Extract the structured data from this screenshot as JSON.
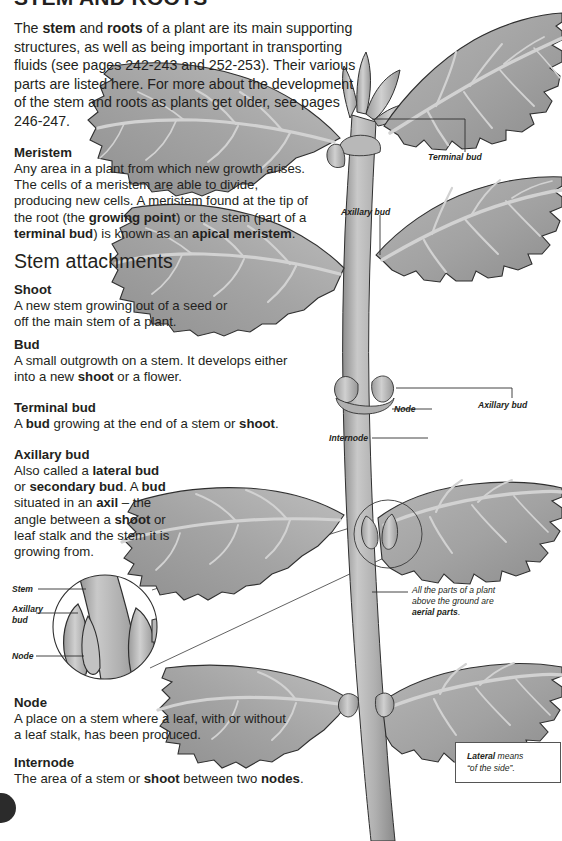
{
  "page": {
    "clipped_heading": "STEM AND ROOTS",
    "intro": "The stem and roots of a plant are its main supporting structures, as well as being important in transporting fluids (see pages 242-243 and 252-253). Their various parts are listed here. For more about the development of the stem and roots as plants get older, see pages 246-247.",
    "intro_bold_terms": [
      "stem",
      "roots"
    ]
  },
  "sections": [
    {
      "id": "meristem",
      "heading": "Meristem",
      "body": "Any area in a plant from which new growth arises. The cells of a meristem are able to divide, producing new cells. A meristem found at the tip of the root (the growing point) or the stem (part of a terminal bud) is known as an apical meristem.",
      "bold_terms": [
        "growing point",
        "terminal bud",
        "apical meristem"
      ]
    },
    {
      "id": "shoot",
      "heading": "Shoot",
      "body": "A new stem growing out of a seed or off the main stem of a plant.",
      "bold_terms": []
    },
    {
      "id": "bud",
      "heading": "Bud",
      "body": "A small outgrowth on a stem. It develops either into a new shoot or a flower.",
      "bold_terms": [
        "shoot"
      ]
    },
    {
      "id": "terminal-bud",
      "heading": "Terminal bud",
      "body": "A bud growing at the end of a stem or shoot.",
      "bold_terms": [
        "bud",
        "shoot"
      ]
    },
    {
      "id": "axillary-bud",
      "heading": "Axillary bud",
      "body": "Also called a lateral bud or secondary bud. A bud situated in an axil – the angle between a shoot or leaf stalk and the stem it is growing from.",
      "bold_terms": [
        "lateral bud",
        "secondary bud",
        "bud",
        "axil",
        "shoot"
      ]
    },
    {
      "id": "node",
      "heading": "Node",
      "body": "A place on a stem where a leaf, with or without a leaf stalk, has been produced.",
      "bold_terms": []
    },
    {
      "id": "internode",
      "heading": "Internode",
      "body": "The area of a stem or shoot between two nodes.",
      "bold_terms": [
        "shoot",
        "nodes"
      ]
    }
  ],
  "big_heading": "Stem attachments",
  "diagram": {
    "labels": [
      {
        "id": "terminal-bud",
        "text": "Terminal bud"
      },
      {
        "id": "axillary-bud-upper",
        "text": "Axillary bud"
      },
      {
        "id": "axillary-bud-lower",
        "text": "Axillary bud"
      },
      {
        "id": "node",
        "text": "Node"
      },
      {
        "id": "internode",
        "text": "Internode"
      }
    ],
    "inset_labels": [
      {
        "id": "inset-stem",
        "text": "Stem"
      },
      {
        "id": "inset-axillary-bud",
        "text": "Axillary bud"
      },
      {
        "id": "inset-node",
        "text": "Node"
      }
    ],
    "aerial_note": {
      "line1": "All the parts of a plant",
      "line2": "above the ground are",
      "bold": "aerial parts",
      "tail": "."
    },
    "definition_box": {
      "bold": "Lateral",
      "rest": " means",
      "line2": "“of the side”."
    }
  },
  "colors": {
    "text": "#231f20",
    "leaf_fill": "#a6a6a6",
    "leaf_fill_dark": "#8f8f8f",
    "leaf_vein": "#cfcfcf",
    "stem_fill": "#b4b4b4",
    "outline": "#2f2f2f",
    "leader_line": "#3a3a3a",
    "page_badge": "#2b2b2b",
    "background": "#ffffff"
  }
}
